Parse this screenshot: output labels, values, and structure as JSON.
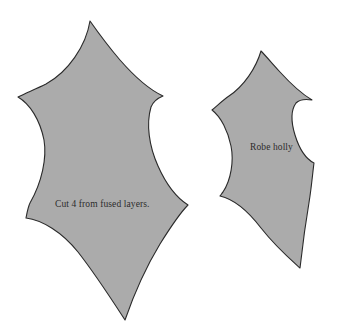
{
  "document": {
    "type": "sewing-pattern-template-sheet",
    "background_color": "#ffffff"
  },
  "pieces": [
    {
      "id": "large-holly-leaf",
      "name": "Large holly leaf pattern piece",
      "label": "Cut 4 from fused layers.",
      "fill_color": "#ababab",
      "stroke_color": "#2a2a2a",
      "stroke_width": 1.1
    },
    {
      "id": "small-holly-leaf",
      "name": "Small holly leaf pattern piece",
      "label": "Robe holly",
      "fill_color": "#ababab",
      "stroke_color": "#2a2a2a",
      "stroke_width": 1.1
    }
  ],
  "labels": {
    "cut_instruction": "Cut 4 from fused layers.",
    "robe_holly": "Robe holly"
  },
  "colors": {
    "piece_fill": "#ababab",
    "piece_outline": "#2a2a2a",
    "label_text": "#2b2b2b",
    "page_background": "#ffffff"
  }
}
